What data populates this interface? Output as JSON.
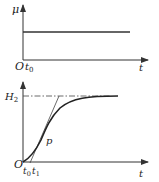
{
  "diagram": {
    "top_plot": {
      "y_label": "μ",
      "origin_label": "O",
      "t0_label": "t",
      "t0_sub": "0",
      "x_label": "t",
      "description": "step input: constant μ from t0"
    },
    "bottom_plot": {
      "y_level_label": "H",
      "y_level_sub": "2",
      "origin_label": "O",
      "t0_label": "t",
      "t0_sub": "0",
      "t1_label": "t",
      "t1_sub": "1",
      "inflection_label": "p",
      "x_label": "t",
      "description": "S-shaped response rising to H2 with tangent at inflection point p"
    },
    "colors": {
      "line": "#333333",
      "background": "#ffffff"
    }
  }
}
